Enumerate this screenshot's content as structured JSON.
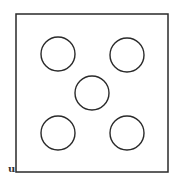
{
  "diagram": {
    "type": "dice-five-pattern",
    "label": "u",
    "stroke_color": "#2a2a2a",
    "background": "#ffffff",
    "square": {
      "x": 16,
      "y": 14,
      "width": 152,
      "height": 158,
      "stroke_width": 1.5
    },
    "circles": [
      {
        "name": "top-left",
        "cx": 58,
        "cy": 54,
        "r": 17
      },
      {
        "name": "top-right",
        "cx": 127,
        "cy": 55,
        "r": 17
      },
      {
        "name": "center",
        "cx": 92,
        "cy": 93,
        "r": 17
      },
      {
        "name": "bottom-left",
        "cx": 58,
        "cy": 133,
        "r": 17
      },
      {
        "name": "bottom-right",
        "cx": 127,
        "cy": 133,
        "r": 17
      }
    ]
  }
}
